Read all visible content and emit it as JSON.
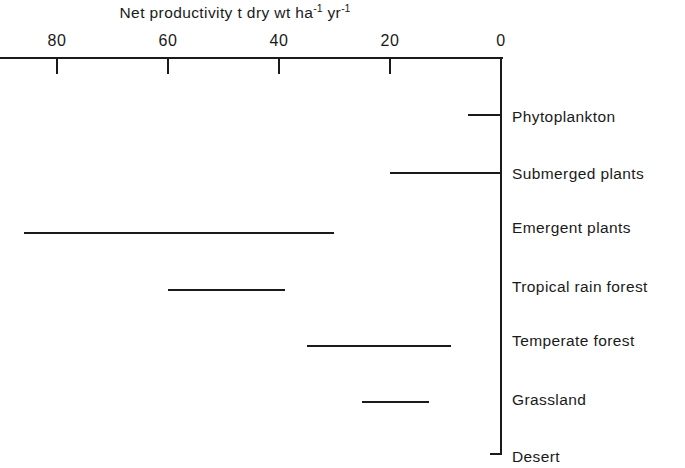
{
  "chart_data": {
    "type": "bar",
    "title_parts": {
      "lead": "Net productivity t dry wt ha",
      "sup1": "-1",
      "mid": " yr",
      "sup2": "-1"
    },
    "xlabel": "",
    "ylabel": "",
    "orientation": "horizontal",
    "x_axis_reversed": true,
    "xlim": [
      0,
      90
    ],
    "grid": false,
    "legend": null,
    "tick_labels": [
      "80",
      "60",
      "40",
      "20",
      "0"
    ],
    "tick_values": [
      80,
      60,
      40,
      20,
      0
    ],
    "categories": [
      "Phytoplankton",
      "Submerged plants",
      "Emergent plants",
      "Tropical rain forest",
      "Temperate forest",
      "Grassland",
      "Desert"
    ],
    "ranges": [
      {
        "label": "Phytoplankton",
        "low": 0,
        "high": 6
      },
      {
        "label": "Submerged plants",
        "low": 0,
        "high": 20
      },
      {
        "label": "Emergent plants",
        "low": 30,
        "high": 86
      },
      {
        "label": "Tropical rain forest",
        "low": 39,
        "high": 60
      },
      {
        "label": "Temperate forest",
        "low": 9,
        "high": 35
      },
      {
        "label": "Grassland",
        "low": 13,
        "high": 25
      },
      {
        "label": "Desert",
        "low": 0,
        "high": 2
      }
    ],
    "colors": {
      "line": "#1a1a1a",
      "background": "#ffffff"
    }
  }
}
